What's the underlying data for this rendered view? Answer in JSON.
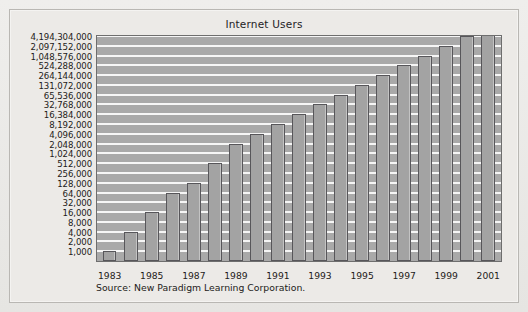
{
  "chart_data": {
    "type": "bar",
    "title": "Internet Users",
    "xlabel": "",
    "ylabel": "",
    "grid": true,
    "legend": null,
    "yscale": "log2",
    "ytick_labels": [
      "4,194,304,000",
      "2,097,152,000",
      "1,048,576,000",
      "524,288,000",
      "264,144,000",
      "131,072,000",
      "65,536,000",
      "32,768,000",
      "16,384,000",
      "8,192,000",
      "4,096,000",
      "2,048,000",
      "1,024,000",
      "512,000",
      "256,000",
      "128,000",
      "64,000",
      "32,000",
      "16,000",
      "8,000",
      "4,000",
      "2,000",
      "1,000"
    ],
    "ytick_values": [
      4194304000,
      2097152000,
      1048576000,
      524288000,
      264144000,
      131072000,
      65536000,
      32768000,
      16384000,
      8192000,
      4096000,
      2048000,
      1024000,
      512000,
      256000,
      128000,
      64000,
      32000,
      16000,
      8000,
      4000,
      2000,
      1000
    ],
    "ylim": [
      1000,
      4194304000
    ],
    "categories": [
      "1983",
      "1984",
      "1985",
      "1986",
      "1987",
      "1988",
      "1989",
      "1990",
      "1991",
      "1992",
      "1993",
      "1994",
      "1995",
      "1996",
      "1997",
      "1998",
      "1999",
      "2000",
      "2001"
    ],
    "xtick_labels": [
      "1983",
      "",
      "1985",
      "",
      "1987",
      "",
      "1989",
      "",
      "1991",
      "",
      "1993",
      "",
      "1995",
      "",
      "1997",
      "",
      "1999",
      "",
      "2001"
    ],
    "values": [
      2000,
      8000,
      32000,
      128000,
      256000,
      1024000,
      4096000,
      8192000,
      16384000,
      32768000,
      65536000,
      131072000,
      264144000,
      524288000,
      1048576000,
      2097152000,
      4194304000,
      8388608000,
      16777216000
    ],
    "bar_levels": [
      1,
      3,
      5,
      7,
      8,
      10,
      12,
      13,
      14,
      15,
      16,
      17,
      18,
      19,
      20,
      21,
      22,
      23,
      24
    ],
    "annotations": [
      "Source: New Paradigm Learning Corporation."
    ]
  },
  "source_note": "Source: New Paradigm Learning Corporation.",
  "colors": {
    "plot_background": "#a9a9a9",
    "gridline": "#f6f6f6",
    "bar_fill": "#a3a3a3",
    "bar_border": "#57565a",
    "panel_background": "#eceae7",
    "panel_border": "#b9b7b3",
    "text": "#1d1b19"
  }
}
